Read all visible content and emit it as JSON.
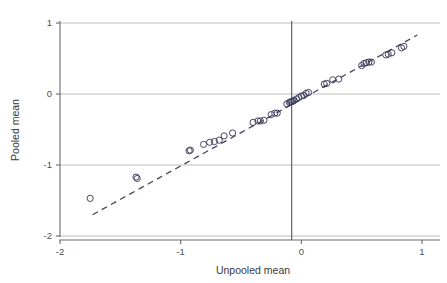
{
  "figure": {
    "kind": "scatter-plot",
    "background_color": "#ffffff"
  },
  "axis_titles": {
    "x": "Unpooled mean",
    "y": "Pooled mean"
  },
  "chart_data": {
    "type": "scatter",
    "title": "",
    "subtitle": "",
    "xlabel": "Unpooled mean",
    "ylabel": "Pooled mean",
    "xlim": [
      -2.0,
      1.0
    ],
    "ylim": [
      -2.0,
      1.0
    ],
    "xticks": [
      -2,
      -1,
      0,
      1
    ],
    "xtick_labels": [
      "-2",
      "-1",
      "0",
      "1"
    ],
    "yticks": [
      1,
      0,
      -1,
      -2
    ],
    "ytick_labels": [
      "1",
      "0",
      "-1",
      "-2"
    ],
    "grid": "horizontal-only",
    "grid_color": "#b4b4b4",
    "legend": null,
    "legend_position": "none",
    "marker": {
      "shape": "open-circle",
      "radius_px": 3.1,
      "stroke": "#3d3d5c",
      "fill": "none"
    },
    "annotations": [
      {
        "name": "identity-reference-line",
        "style": "dashed",
        "color": "#3d3d5c",
        "from": [
          -1.73,
          -1.7
        ],
        "to": [
          0.96,
          0.83
        ]
      },
      {
        "name": "vertical-reference-line",
        "style": "solid",
        "color": "#555566",
        "x": -0.08
      }
    ],
    "series": [
      {
        "name": "study means",
        "points": [
          [
            -1.75,
            -1.47
          ],
          [
            -1.37,
            -1.17
          ],
          [
            -1.36,
            -1.19
          ],
          [
            -0.93,
            -0.8
          ],
          [
            -0.92,
            -0.79
          ],
          [
            -0.81,
            -0.71
          ],
          [
            -0.76,
            -0.68
          ],
          [
            -0.72,
            -0.67
          ],
          [
            -0.68,
            -0.65
          ],
          [
            -0.64,
            -0.59
          ],
          [
            -0.57,
            -0.55
          ],
          [
            -0.4,
            -0.4
          ],
          [
            -0.36,
            -0.38
          ],
          [
            -0.34,
            -0.38
          ],
          [
            -0.31,
            -0.37
          ],
          [
            -0.25,
            -0.29
          ],
          [
            -0.22,
            -0.27
          ],
          [
            -0.2,
            -0.27
          ],
          [
            -0.12,
            -0.14
          ],
          [
            -0.1,
            -0.12
          ],
          [
            -0.09,
            -0.11
          ],
          [
            -0.08,
            -0.11
          ],
          [
            -0.07,
            -0.1
          ],
          [
            -0.06,
            -0.09
          ],
          [
            -0.04,
            -0.07
          ],
          [
            -0.02,
            -0.05
          ],
          [
            0.0,
            -0.03
          ],
          [
            0.02,
            -0.02
          ],
          [
            0.04,
            0.01
          ],
          [
            0.06,
            0.02
          ],
          [
            0.19,
            0.14
          ],
          [
            0.21,
            0.15
          ],
          [
            0.26,
            0.2
          ],
          [
            0.31,
            0.21
          ],
          [
            0.5,
            0.4
          ],
          [
            0.52,
            0.43
          ],
          [
            0.54,
            0.44
          ],
          [
            0.56,
            0.45
          ],
          [
            0.58,
            0.45
          ],
          [
            0.7,
            0.55
          ],
          [
            0.72,
            0.56
          ],
          [
            0.75,
            0.58
          ],
          [
            0.83,
            0.65
          ],
          [
            0.85,
            0.67
          ]
        ]
      }
    ]
  }
}
